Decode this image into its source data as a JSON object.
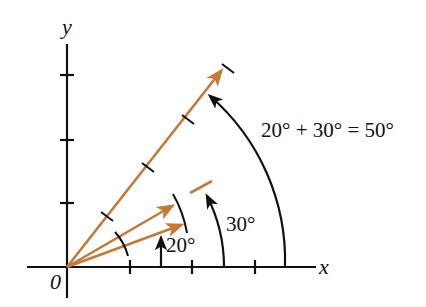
{
  "diagram": {
    "axes": {
      "x_label": "x",
      "y_label": "y",
      "origin_label": "0"
    },
    "angles": {
      "first": "20°",
      "second": "30°",
      "sum": "20° + 30° = 50°"
    },
    "colors": {
      "vector": "#c07a3a",
      "ink": "#111111"
    }
  }
}
